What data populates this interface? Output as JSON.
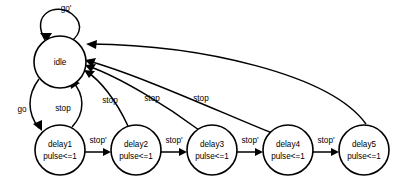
{
  "diagram": {
    "type": "finite-state-machine",
    "title": "",
    "background_color": "#ffffff",
    "stroke_color": "#000000",
    "text_color": "#000000",
    "states": [
      {
        "id": "idle",
        "label": "idle",
        "sublabel": "",
        "cx": 60,
        "cy": 62,
        "r": 26
      },
      {
        "id": "delay1",
        "label": "delay1",
        "sublabel": "pulse<=1",
        "cx": 60,
        "cy": 150,
        "r": 25
      },
      {
        "id": "delay2",
        "label": "delay2",
        "sublabel": "pulse<=1",
        "cx": 136,
        "cy": 150,
        "r": 25
      },
      {
        "id": "delay3",
        "label": "delay3",
        "sublabel": "pulse<=1",
        "cx": 212,
        "cy": 150,
        "r": 25
      },
      {
        "id": "delay4",
        "label": "delay4",
        "sublabel": "pulse<=1",
        "cx": 288,
        "cy": 150,
        "r": 25
      },
      {
        "id": "delay5",
        "label": "delay5",
        "sublabel": "pulse<=1",
        "cx": 364,
        "cy": 150,
        "r": 25
      }
    ],
    "transitions": [
      {
        "id": "idle-self",
        "from": "idle",
        "to": "idle",
        "label": "go'",
        "label_x": 66,
        "label_y": 9
      },
      {
        "id": "idle-delay1",
        "from": "idle",
        "to": "delay1",
        "label": "go",
        "label_x": 22,
        "label_y": 110
      },
      {
        "id": "delay1-idle",
        "from": "delay1",
        "to": "idle",
        "label": "stop",
        "label_x": 63,
        "label_y": 109
      },
      {
        "id": "delay2-idle",
        "from": "delay2",
        "to": "idle",
        "label": "stop",
        "label_x": 110,
        "label_y": 101
      },
      {
        "id": "delay3-idle",
        "from": "delay3",
        "to": "idle",
        "label": "stop",
        "label_x": 152,
        "label_y": 99
      },
      {
        "id": "delay4-idle",
        "from": "delay4",
        "to": "idle",
        "label": "stop",
        "label_x": 201,
        "label_y": 99
      },
      {
        "id": "delay5-idle",
        "from": "delay5",
        "to": "idle",
        "label": "",
        "label_x": 0,
        "label_y": 0
      },
      {
        "id": "delay1-delay2",
        "from": "delay1",
        "to": "delay2",
        "label": "stop'",
        "label_x": 98,
        "label_y": 141
      },
      {
        "id": "delay2-delay3",
        "from": "delay2",
        "to": "delay3",
        "label": "stop'",
        "label_x": 174,
        "label_y": 141
      },
      {
        "id": "delay3-delay4",
        "from": "delay3",
        "to": "delay4",
        "label": "stop'",
        "label_x": 250,
        "label_y": 141
      },
      {
        "id": "delay4-delay5",
        "from": "delay4",
        "to": "delay5",
        "label": "stop'",
        "label_x": 326,
        "label_y": 141
      }
    ]
  }
}
